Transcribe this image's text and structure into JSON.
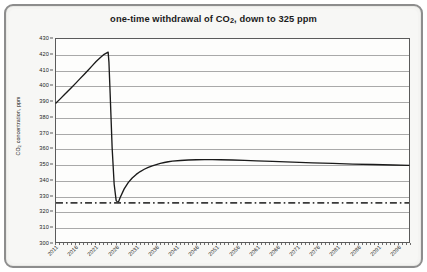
{
  "chart_data": {
    "type": "line",
    "title": "one-time withdrawal of CO2, down to 325 ppm",
    "title_main": "one-time withdrawal of CO",
    "title_sub": "2",
    "title_tail": ", down to 325 ppm",
    "xlabel": "",
    "ylabel": "CO2 concentration, ppm",
    "ylabel_main": "CO",
    "ylabel_sub": "2",
    "ylabel_tail": " concentration, ppm",
    "xlim": [
      2011,
      2099
    ],
    "ylim": [
      300,
      430
    ],
    "ytick_step": 10,
    "yticks": [
      300,
      310,
      320,
      330,
      340,
      350,
      360,
      370,
      380,
      390,
      400,
      410,
      420,
      430
    ],
    "ytick_labels": [
      "300",
      "310",
      "320",
      "330",
      "340",
      "350",
      "360",
      "370",
      "380",
      "390",
      "400",
      "410",
      "420",
      "430"
    ],
    "xticks": [
      2011,
      2016,
      2021,
      2026,
      2031,
      2036,
      2041,
      2046,
      2051,
      2056,
      2061,
      2066,
      2071,
      2076,
      2081,
      2086,
      2091,
      2096
    ],
    "xtick_labels": [
      "2011",
      "2016",
      "2021",
      "2026",
      "2031",
      "2036",
      "2041",
      "2046",
      "2051",
      "2056",
      "2061",
      "2066",
      "2071",
      "2076",
      "2081",
      "2086",
      "2091",
      "2096"
    ],
    "grid": "horizontal",
    "legend": "none",
    "series": [
      {
        "name": "CO2 concentration",
        "style": "solid",
        "color": "#1a1a1a",
        "x": [
          2011,
          2012,
          2013,
          2014,
          2015,
          2016,
          2017,
          2018,
          2019,
          2020,
          2021,
          2022,
          2023,
          2024,
          2024.2,
          2024.5,
          2025,
          2025.5,
          2026,
          2026.5,
          2027,
          2028,
          2029,
          2030,
          2031,
          2032,
          2033,
          2034,
          2035,
          2036,
          2037,
          2038,
          2039,
          2040,
          2042,
          2044,
          2046,
          2048,
          2050,
          2052,
          2055,
          2058,
          2061,
          2065,
          2070,
          2075,
          2080,
          2085,
          2090,
          2095,
          2099
        ],
        "y": [
          389.0,
          391.5,
          394.1,
          396.7,
          399.3,
          401.9,
          404.6,
          407.3,
          410.0,
          412.8,
          415.6,
          418.0,
          420.2,
          421.6,
          415.0,
          395.0,
          360.0,
          337.0,
          326.5,
          325.2,
          328.5,
          334.0,
          338.0,
          341.0,
          343.3,
          345.1,
          346.6,
          347.8,
          348.8,
          349.6,
          350.3,
          350.9,
          351.4,
          351.8,
          352.2,
          352.5,
          352.7,
          352.8,
          352.8,
          352.7,
          352.5,
          352.3,
          352.0,
          351.6,
          351.1,
          350.7,
          350.3,
          349.9,
          349.6,
          349.3,
          349.1
        ]
      },
      {
        "name": "325 ppm reference",
        "style": "dash-dot",
        "color": "#3a3a3a",
        "value": 325,
        "constant": true
      }
    ],
    "annotations": {
      "start_value": 389,
      "peak_value": 421.6,
      "peak_year": 2024,
      "withdrawal_floor": 325,
      "withdrawal_year": 2025,
      "rebound_plateau": 352.8,
      "end_value": 349.1
    }
  }
}
